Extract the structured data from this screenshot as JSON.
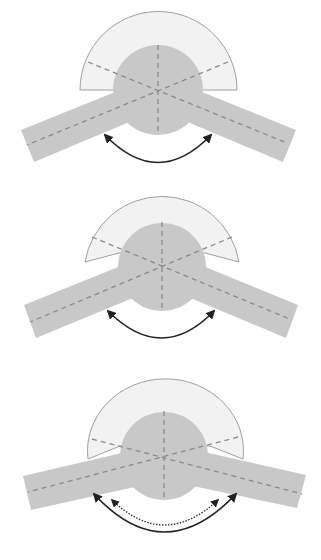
{
  "figure": {
    "colors": {
      "background": "#ffffff",
      "arm_fill": "#c8c8c8",
      "hub_fill": "#c8c8c8",
      "fan_fill": "#f2f2f2",
      "fan_stroke": "#a0a0a0",
      "axis_dash": "#8a8a8a",
      "arrow": "#222222"
    },
    "panels": [
      {
        "id": "panel-1",
        "arm_angle_deg": 22,
        "fan_base": "flat",
        "arrows": [
          {
            "style": "solid"
          }
        ]
      },
      {
        "id": "panel-2",
        "arm_angle_deg": 22,
        "fan_base": "tilted",
        "arrows": [
          {
            "style": "solid"
          }
        ]
      },
      {
        "id": "panel-3",
        "arm_angle_deg": 15,
        "fan_base": "wide",
        "arrows": [
          {
            "style": "solid"
          },
          {
            "style": "dotted"
          }
        ]
      }
    ]
  }
}
